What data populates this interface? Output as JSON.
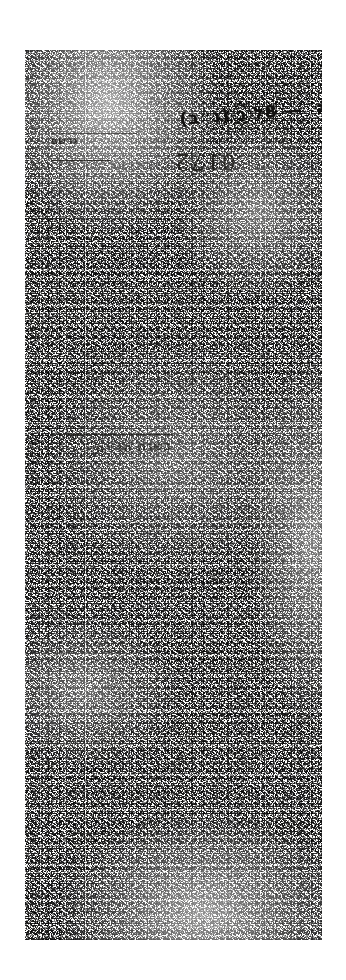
{
  "document": {
    "kind": "archival-manuscript-scan",
    "orientation": "portrait",
    "ink_color": "#15130f",
    "paper_color": "#fdfdfc",
    "page_background": "#ffffff"
  },
  "marks": {
    "hebrew_annotation": {
      "text_before": "ל״ה ‎8 ‎— ‎ל",
      "circled": "ב",
      "text_after": "(נ״ב)",
      "full": "ל״ה 8 — ל (ב) (נ״ב)"
    },
    "margin_note": "נרשם",
    "middle_note": "בשנת תר״ח",
    "stamp_verso": "0172",
    "stamp_folio": "0172"
  },
  "rules": {
    "top_rule_1": "horizontal-rule",
    "top_rule_2": "horizontal-rule",
    "middle_rule": "horizontal-rule"
  }
}
